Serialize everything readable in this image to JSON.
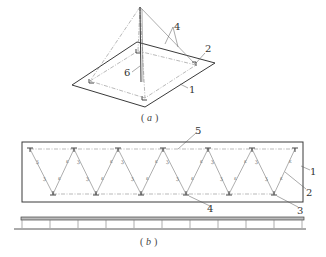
{
  "figure": {
    "panel_a": {
      "caption": "（a）",
      "caption_letter": "a",
      "labels": {
        "plate": "1",
        "corner_anchor": "2",
        "guy_wires": "4",
        "mast": "6"
      }
    },
    "panel_b": {
      "caption": "（b）",
      "caption_letter": "b",
      "labels": {
        "frame": "1",
        "diagonal": "2",
        "bottom_node": "3",
        "web_member": "4",
        "top_chord": "5"
      },
      "top_nodes_x": [
        30,
        74,
        118,
        163,
        208,
        252,
        295
      ],
      "bottom_nodes_x": [
        53,
        96,
        141,
        186,
        229,
        274
      ],
      "elevation_posts_x": [
        22,
        50,
        78,
        106,
        134,
        162,
        190,
        218,
        246,
        274,
        302
      ]
    }
  }
}
